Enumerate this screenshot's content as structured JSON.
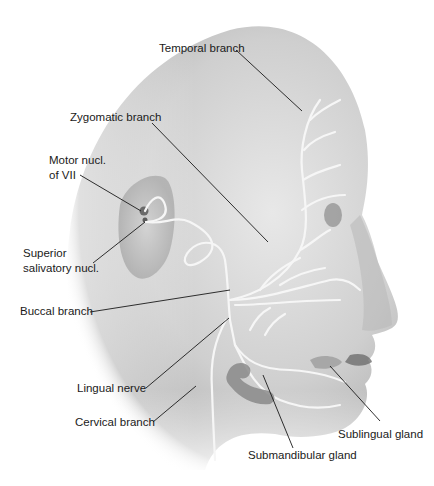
{
  "figure": {
    "colors": {
      "background": "#ffffff",
      "skin_light": "#e6e6e6",
      "skin_mid": "#c4c4c4",
      "skin_dark": "#8a8a8a",
      "nerve": "#f4f4f4",
      "leader_line": "#1a1a1a",
      "nucleus": "#6a6a6a",
      "gland": "#9a9a9a"
    }
  },
  "labels": {
    "temporal_branch": "Temporal branch",
    "zygomatic_branch": "Zygomatic branch",
    "motor_nucl_line1": "Motor nucl.",
    "motor_nucl_line2": "of VII",
    "superior_salivatory_line1": "Superior",
    "superior_salivatory_line2": "salivatory nucl.",
    "buccal_branch": "Buccal branch",
    "lingual_nerve": "Lingual nerve",
    "cervical_branch": "Cervical branch",
    "sublingual_gland": "Sublingual gland",
    "submandibular_gland": "Submandibular gland"
  }
}
